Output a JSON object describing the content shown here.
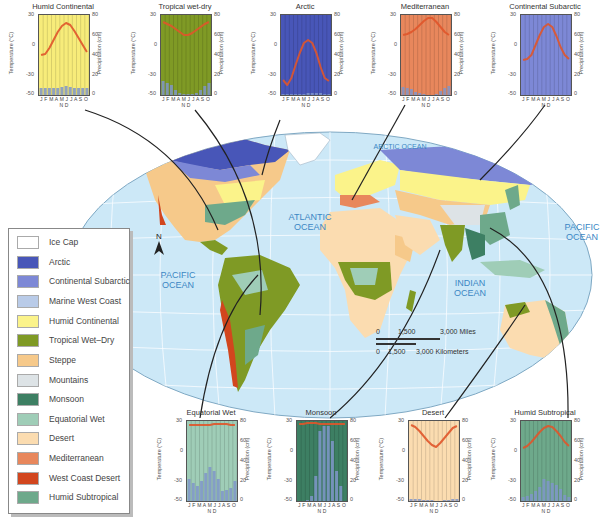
{
  "map": {
    "oceans": [
      {
        "label_line1": "ATLANTIC",
        "label_line2": "OCEAN"
      },
      {
        "label_line1": "PACIFIC",
        "label_line2": "OCEAN"
      },
      {
        "label_line1": "PACIFIC",
        "label_line2": "OCEAN"
      },
      {
        "label_line1": "INDIAN",
        "label_line2": "OCEAN"
      },
      {
        "label_line1": "ARCTIC OCEAN",
        "label_line2": ""
      }
    ],
    "north_arrow": "N",
    "scale_bar": {
      "miles": [
        "0",
        "1,500",
        "3,000 Miles"
      ],
      "km": [
        "0",
        "1,500",
        "3,000 Kilometers"
      ]
    },
    "colors": {
      "ocean": "#cde8f7",
      "grid": "#ffffff"
    }
  },
  "legend": {
    "items": [
      {
        "label": "Ice Cap",
        "color": "#ffffff"
      },
      {
        "label": "Arctic",
        "color": "#4856b8"
      },
      {
        "label": "Continental Subarctic",
        "color": "#7d88d6"
      },
      {
        "label": "Marine West Coast",
        "color": "#b9cbe8"
      },
      {
        "label": "Humid Continental",
        "color": "#fbf38a"
      },
      {
        "label": "Tropical Wet–Dry",
        "color": "#7f9a25"
      },
      {
        "label": "Steppe",
        "color": "#f6c98a"
      },
      {
        "label": "Mountains",
        "color": "#dde3e6"
      },
      {
        "label": "Monsoon",
        "color": "#3d7f63"
      },
      {
        "label": "Equatorial Wet",
        "color": "#9fcdb7"
      },
      {
        "label": "Desert",
        "color": "#fbdcb0"
      },
      {
        "label": "Mediterranean",
        "color": "#e8875c"
      },
      {
        "label": "West Coast Desert",
        "color": "#d2461e"
      },
      {
        "label": "Humid Subtropical",
        "color": "#6ea98b"
      }
    ]
  },
  "chart_common": {
    "months": "J F M A M J J A S O N D",
    "temp_axis_label": "Temperature (°C)",
    "precip_axis_label": "Precipitation (cm)",
    "temp_ticks": [
      "30",
      "0",
      "-30",
      "-50"
    ],
    "precip_ticks": [
      "80",
      "60",
      "40",
      "20",
      "0"
    ]
  },
  "chart_data": [
    {
      "type": "line",
      "title": "Humid Continental",
      "bg": "#f7ec7a",
      "categories": [
        "J",
        "F",
        "M",
        "A",
        "M",
        "J",
        "J",
        "A",
        "S",
        "O",
        "N",
        "D"
      ],
      "series": [
        {
          "name": "Temperature (°C)",
          "values": [
            -10,
            -9,
            -3,
            5,
            13,
            19,
            22,
            20,
            14,
            7,
            0,
            -7
          ]
        },
        {
          "name": "Precipitation (cm)",
          "values": [
            7,
            7,
            7,
            7,
            7,
            8,
            9,
            8,
            7,
            7,
            7,
            7
          ]
        }
      ],
      "ylim_temp": [
        -50,
        30
      ],
      "ylim_precip": [
        0,
        80
      ]
    },
    {
      "type": "line",
      "title": "Tropical wet-dry",
      "bg": "#7f9a25",
      "categories": [
        "J",
        "F",
        "M",
        "A",
        "M",
        "J",
        "J",
        "A",
        "S",
        "O",
        "N",
        "D"
      ],
      "series": [
        {
          "name": "Temperature (°C)",
          "values": [
            23,
            21,
            19,
            16,
            13,
            10,
            10,
            12,
            15,
            18,
            21,
            23
          ]
        },
        {
          "name": "Precipitation (cm)",
          "values": [
            14,
            12,
            10,
            5,
            2,
            1,
            1,
            1,
            2,
            5,
            9,
            12
          ]
        }
      ],
      "ylim_temp": [
        -50,
        30
      ],
      "ylim_precip": [
        0,
        80
      ]
    },
    {
      "type": "line",
      "title": "Arctic",
      "bg": "#4856b8",
      "categories": [
        "J",
        "F",
        "M",
        "A",
        "M",
        "J",
        "J",
        "A",
        "S",
        "O",
        "N",
        "D"
      ],
      "series": [
        {
          "name": "Temperature (°C)",
          "values": [
            -35,
            -40,
            -33,
            -20,
            -8,
            2,
            5,
            2,
            -8,
            -22,
            -33,
            -36
          ]
        },
        {
          "name": "Precipitation (cm)",
          "values": [
            1,
            1,
            1,
            1,
            1,
            1,
            2,
            2,
            2,
            2,
            1,
            1
          ]
        }
      ],
      "ylim_temp": [
        -50,
        30
      ],
      "ylim_precip": [
        0,
        80
      ]
    },
    {
      "type": "line",
      "title": "Mediterranean",
      "bg": "#e8875c",
      "categories": [
        "J",
        "F",
        "M",
        "A",
        "M",
        "J",
        "J",
        "A",
        "S",
        "O",
        "N",
        "D"
      ],
      "series": [
        {
          "name": "Temperature (°C)",
          "values": [
            10,
            11,
            13,
            16,
            20,
            24,
            27,
            27,
            23,
            18,
            13,
            10
          ]
        },
        {
          "name": "Precipitation (cm)",
          "values": [
            8,
            7,
            6,
            3,
            2,
            1,
            0,
            0,
            1,
            4,
            7,
            9
          ]
        }
      ],
      "ylim_temp": [
        -50,
        30
      ],
      "ylim_precip": [
        0,
        80
      ]
    },
    {
      "type": "line",
      "title": "Continental Subarctic",
      "bg": "#7d88d6",
      "categories": [
        "J",
        "F",
        "M",
        "A",
        "M",
        "J",
        "J",
        "A",
        "S",
        "O",
        "N",
        "D"
      ],
      "series": [
        {
          "name": "Temperature (°C)",
          "values": [
            -15,
            -14,
            -10,
            0,
            10,
            18,
            21,
            18,
            9,
            -2,
            -10,
            -14
          ]
        },
        {
          "name": "Precipitation (cm)",
          "values": [
            0,
            0,
            0,
            0,
            0,
            0,
            0,
            0,
            0,
            0,
            0,
            0
          ]
        }
      ],
      "ylim_temp": [
        -50,
        30
      ],
      "ylim_precip": [
        0,
        80
      ]
    },
    {
      "type": "line",
      "title": "Equatorial Wet",
      "bg": "#9fcdb7",
      "categories": [
        "J",
        "F",
        "M",
        "A",
        "M",
        "J",
        "J",
        "A",
        "S",
        "O",
        "N",
        "D"
      ],
      "series": [
        {
          "name": "Temperature (°C)",
          "values": [
            26,
            26,
            26,
            26,
            26,
            26,
            27,
            27,
            27,
            27,
            26,
            26
          ]
        },
        {
          "name": "Precipitation (cm)",
          "values": [
            22,
            18,
            15,
            20,
            28,
            34,
            30,
            22,
            10,
            11,
            13,
            20
          ]
        }
      ],
      "ylim_temp": [
        -50,
        30
      ],
      "ylim_precip": [
        0,
        80
      ]
    },
    {
      "type": "line",
      "title": "Monsoon",
      "bg": "#3d7f63",
      "categories": [
        "J",
        "F",
        "M",
        "A",
        "M",
        "J",
        "J",
        "A",
        "S",
        "O",
        "N",
        "D"
      ],
      "series": [
        {
          "name": "Temperature (°C)",
          "values": [
            27,
            27,
            28,
            28,
            28,
            27,
            27,
            27,
            27,
            27,
            27,
            27
          ]
        },
        {
          "name": "Precipitation (cm)",
          "values": [
            0,
            0,
            1,
            5,
            25,
            70,
            75,
            75,
            60,
            30,
            15,
            0
          ]
        }
      ],
      "ylim_temp": [
        -50,
        30
      ],
      "ylim_precip": [
        0,
        80
      ]
    },
    {
      "type": "line",
      "title": "Desert",
      "bg": "#fbdcb0",
      "categories": [
        "J",
        "F",
        "M",
        "A",
        "M",
        "J",
        "J",
        "A",
        "S",
        "O",
        "N",
        "D"
      ],
      "series": [
        {
          "name": "Temperature (°C)",
          "values": [
            26,
            24,
            20,
            15,
            10,
            6,
            4,
            8,
            13,
            18,
            23,
            25
          ]
        },
        {
          "name": "Precipitation (cm)",
          "values": [
            2,
            2,
            2,
            1,
            1,
            1,
            0,
            0,
            1,
            1,
            2,
            2
          ]
        }
      ],
      "ylim_temp": [
        -50,
        30
      ],
      "ylim_precip": [
        0,
        80
      ]
    },
    {
      "type": "line",
      "title": "Humid Subtropical",
      "bg": "#6ea98b",
      "categories": [
        "J",
        "F",
        "M",
        "A",
        "M",
        "J",
        "J",
        "A",
        "S",
        "O",
        "N",
        "D"
      ],
      "series": [
        {
          "name": "Temperature (°C)",
          "values": [
            3,
            5,
            9,
            14,
            19,
            23,
            25,
            24,
            20,
            15,
            9,
            5
          ]
        },
        {
          "name": "Precipitation (cm)",
          "values": [
            4,
            5,
            7,
            10,
            14,
            22,
            20,
            18,
            16,
            12,
            6,
            4
          ]
        }
      ],
      "ylim_temp": [
        -50,
        30
      ],
      "ylim_precip": [
        0,
        80
      ]
    }
  ]
}
